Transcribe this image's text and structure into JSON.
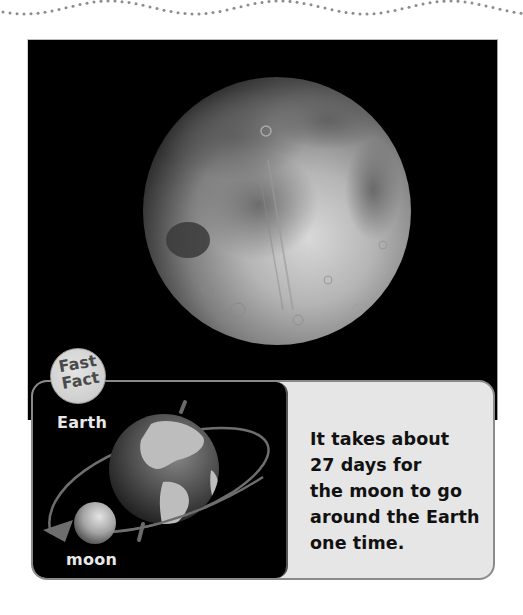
{
  "page": {
    "decoration": "dotted-wave-border",
    "photo": {
      "subject": "moon",
      "icon": "moon-photo"
    },
    "fast_fact": {
      "badge_line1": "Fast",
      "badge_line2": "Fact",
      "diagram": {
        "earth_label": "Earth",
        "moon_label": "moon",
        "icons": [
          "earth-globe-icon",
          "moon-sphere-icon",
          "orbit-arrow-icon"
        ]
      },
      "text_lines": [
        "It takes about",
        "27 days for",
        "the moon to go",
        "around the Earth",
        "one time."
      ]
    }
  },
  "colors": {
    "wave_dots": "#8c8c8c",
    "photo_background": "#000000",
    "panel_background": "#e6e6e6",
    "panel_border": "#8a8a8a",
    "badge_fill": "#d4d4d4",
    "badge_text": "#4a4a4a",
    "label_text": "#e8e8e8",
    "fact_text": "#111111"
  }
}
